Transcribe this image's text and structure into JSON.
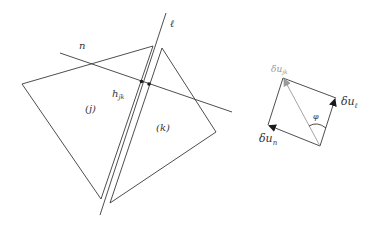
{
  "diagram": {
    "title": "",
    "colors": {
      "line": "#3a3a3a",
      "secondary": "#9a9a9a",
      "background": "#ffffff"
    },
    "left_figure": {
      "line_n_label": "n",
      "line_l_label": "ℓ",
      "edge_point_label_main": "h",
      "edge_point_label_sub": "jk",
      "triangle_j_label": "(j)",
      "triangle_k_label": "(k)"
    },
    "right_figure": {
      "diagonal_label_main": "δu",
      "diagonal_label_sub": "jk",
      "vector_l_label_main": "δu",
      "vector_l_label_sub": "ℓ",
      "vector_n_label_main": "δu",
      "vector_n_label_sub": "n",
      "angle_label": "φ"
    }
  }
}
